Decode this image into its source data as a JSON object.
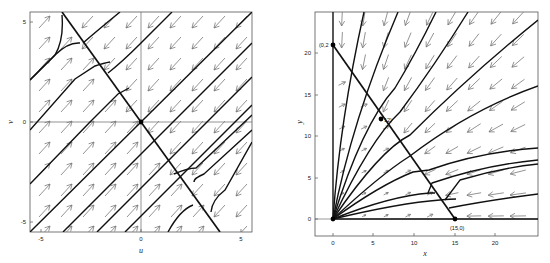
{
  "chart_data": [
    {
      "type": "phase-portrait",
      "panel": "left",
      "title": "",
      "xlabel": "u",
      "ylabel": "v",
      "xlim": [
        -5.5,
        5.5
      ],
      "ylim": [
        -5.5,
        5.5
      ],
      "xticks": [
        -5,
        0,
        5
      ],
      "yticks": [
        -5,
        0,
        5
      ],
      "grid": false,
      "axes_lines": true,
      "equilibrium_points": [
        {
          "x": 0,
          "y": 0
        }
      ],
      "separatrix": {
        "from": [
          -4,
          5.5
        ],
        "to": [
          4,
          -5.5
        ],
        "description": "line v = -1.375u (approx), through origin"
      },
      "trajectories": [
        [
          [
            -5.5,
            -5.5
          ],
          [
            5.5,
            5.5
          ]
        ],
        [
          [
            -3.9,
            -5.5
          ],
          [
            5.5,
            3.9
          ]
        ],
        [
          [
            -2.2,
            -5.5
          ],
          [
            5.5,
            2.2
          ]
        ],
        [
          [
            -0.8,
            -5.5
          ],
          [
            5.5,
            0.8
          ]
        ],
        [
          [
            -5.5,
            -3.1
          ],
          [
            -1.6,
            0.0
          ],
          [
            0,
            2.5
          ]
        ],
        [
          [
            -5.5,
            -0.4
          ],
          [
            -2.3,
            2.7
          ],
          [
            -1.9,
            3.2
          ]
        ],
        [
          [
            -5.5,
            2.1
          ],
          [
            -3.8,
            3.9
          ]
        ],
        [
          [
            1.5,
            -5.5
          ],
          [
            2.6,
            -4.7
          ],
          [
            3.0,
            -4.4
          ]
        ],
        [
          [
            2.2,
            -3.9
          ],
          [
            3.2,
            -1.0
          ],
          [
            5.5,
            1.1
          ]
        ]
      ],
      "vector_field": {
        "left_of_separatrix": "arrows point up-right (NE)",
        "right_of_separatrix": "arrows point down-left (SW)"
      }
    },
    {
      "type": "phase-portrait",
      "panel": "right",
      "title": "",
      "xlabel": "x",
      "ylabel": "y",
      "xlim": [
        -2,
        25
      ],
      "ylim": [
        -2,
        25
      ],
      "xticks": [
        0,
        5,
        10,
        15,
        20
      ],
      "yticks": [
        0,
        5,
        10,
        15,
        20
      ],
      "grid": false,
      "equilibrium_points": [
        {
          "x": 0,
          "y": 0,
          "label": ""
        },
        {
          "x": 0,
          "y": 21,
          "label": "(0,21)"
        },
        {
          "x": 6,
          "y": 12,
          "label": "(6,12)"
        },
        {
          "x": 15,
          "y": 0,
          "label": "(15,0)"
        }
      ],
      "visible_point_labels": [
        "(0,2",
        "12)",
        "(15,0)"
      ],
      "nullcline": {
        "from": [
          0,
          21
        ],
        "to": [
          15,
          0
        ]
      },
      "trajectories_from_origin_to_right_edge_y": [
        24.5,
        16,
        8.5,
        3.2,
        0
      ],
      "trajectories_from_origin_to_top_edge_x": [
        0,
        3.8,
        8,
        12.5,
        17,
        25
      ],
      "kinks_on_nullcline": [
        [
          2.2,
          17.9
        ],
        [
          3.7,
          15.8
        ],
        [
          5.4,
          13.5
        ],
        [
          8,
          10
        ],
        [
          9.5,
          7.7
        ],
        [
          11.9,
          4.4
        ],
        [
          13.6,
          1.9
        ]
      ],
      "vector_field": {
        "below_nullcline": "arrows point right / up-right",
        "above_nullcline": "arrows point left / down-left"
      }
    }
  ],
  "left_panel": {
    "xlabel": "u",
    "ylabel": "v",
    "xtick_labels": [
      "-5",
      "0",
      "5"
    ],
    "ytick_labels": [
      "5",
      "0",
      "-5"
    ]
  },
  "right_panel": {
    "xlabel": "x",
    "ylabel": "y",
    "xtick_labels": [
      "0",
      "5",
      "10",
      "15",
      "20"
    ],
    "ytick_labels": [
      "20",
      "15",
      "10",
      "5",
      "0"
    ],
    "point_labels": {
      "p021": "(0,2",
      "p612": "12)",
      "p150": "(15,0)"
    }
  }
}
